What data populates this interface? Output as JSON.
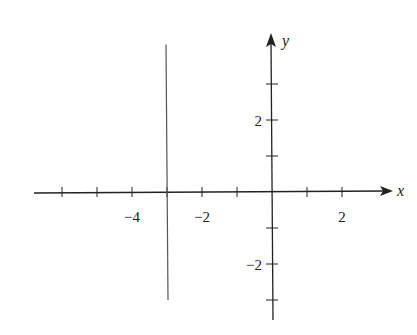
{
  "chart_data": {
    "type": "line",
    "title": "",
    "xlabel": "x",
    "ylabel": "y",
    "xlim": [
      -6.8,
      3.5
    ],
    "ylim": [
      -3.6,
      4.5
    ],
    "grid": false,
    "legend": null,
    "x_ticks": [
      -6,
      -5,
      -4,
      -3,
      -2,
      -1,
      1,
      2
    ],
    "y_ticks": [
      -3,
      -2,
      -1,
      1,
      2,
      3
    ],
    "x_tick_labels": [
      {
        "value": -4,
        "text": "−4"
      },
      {
        "value": -2,
        "text": "−2"
      },
      {
        "value": 2,
        "text": "2"
      }
    ],
    "y_tick_labels": [
      {
        "value": 2,
        "text": "2"
      },
      {
        "value": -2,
        "text": "−2"
      }
    ],
    "series": [
      {
        "name": "x = -3",
        "kind": "vertical-line",
        "x": [
          -3,
          -3
        ],
        "y": [
          -3,
          4.1
        ],
        "color": "#555555"
      }
    ]
  },
  "axes": {
    "x_label": "x",
    "y_label": "y"
  },
  "colors": {
    "axis": "#222222",
    "line": "#555555",
    "background": "#ffffff"
  }
}
